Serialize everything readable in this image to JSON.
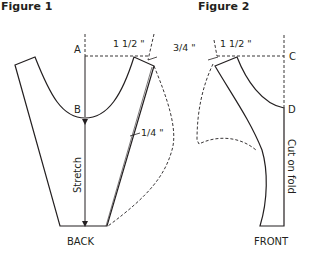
{
  "figures": [
    {
      "title": "Figure 1",
      "piece_label": "BACK",
      "points": {
        "a": "A",
        "b": "B"
      },
      "annotations": {
        "width_top": "1 1/2 \"",
        "side_add": "1/4 \"",
        "center_line": "Stretch"
      }
    },
    {
      "title": "Figure 2",
      "piece_label": "FRONT",
      "points": {
        "c": "C",
        "d": "D"
      },
      "annotations": {
        "shoulder_drop": "3/4 \"",
        "width_top": "1 1/2 \"",
        "fold_line": "Cut on fold"
      }
    }
  ],
  "colors": {
    "line": "#231f20",
    "background": "#ffffff"
  }
}
